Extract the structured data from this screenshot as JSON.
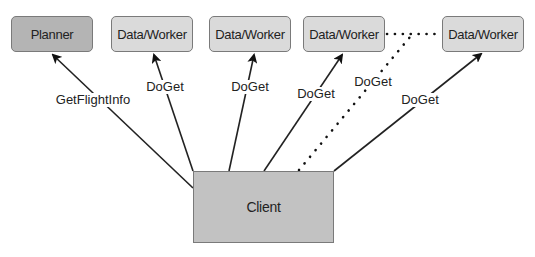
{
  "diagram": {
    "nodes": {
      "planner": {
        "label": "Planner",
        "fill": "#b4b4b4"
      },
      "worker1": {
        "label": "Data/Worker",
        "fill": "#dadada"
      },
      "worker2": {
        "label": "Data/Worker",
        "fill": "#dadada"
      },
      "worker3": {
        "label": "Data/Worker",
        "fill": "#dadada"
      },
      "worker4": {
        "label": "Data/Worker",
        "fill": "#dadada"
      },
      "client": {
        "label": "Client",
        "fill": "#c2c2c2"
      }
    },
    "edges": [
      {
        "from": "client",
        "to": "planner",
        "label": "GetFlightInfo",
        "style": "solid"
      },
      {
        "from": "client",
        "to": "worker1",
        "label": "DoGet",
        "style": "solid"
      },
      {
        "from": "client",
        "to": "worker2",
        "label": "DoGet",
        "style": "solid"
      },
      {
        "from": "client",
        "to": "worker3",
        "label": "DoGet",
        "style": "solid"
      },
      {
        "from": "client",
        "to": "worker3-worker4-link",
        "label": "DoGet",
        "style": "dotted"
      },
      {
        "from": "client",
        "to": "worker4",
        "label": "DoGet",
        "style": "solid"
      },
      {
        "from": "worker3",
        "to": "worker4",
        "label": "",
        "style": "dotted"
      }
    ]
  }
}
